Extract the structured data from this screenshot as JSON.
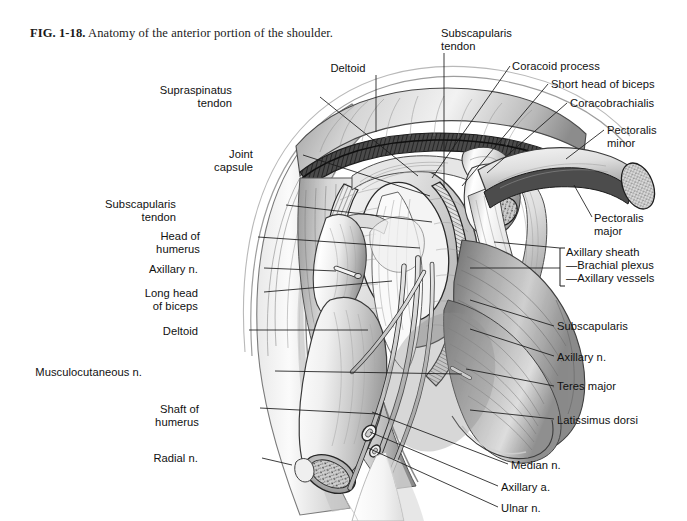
{
  "figure": {
    "number": "FIG. 1-18.",
    "caption": " Anatomy of the anterior portion of the shoulder.",
    "title": "Anatomy of the anterior portion of the shoulder",
    "type": "anatomical-illustration",
    "style": "grayscale pen-and-ink / airbrush medical illustration",
    "background_color": "#ffffff",
    "ink_color": "#1a1a1a"
  },
  "labels": {
    "left": [
      {
        "id": "supraspinatus-tendon",
        "text": "Supraspinatus\ntendon",
        "x": 232,
        "y": 84,
        "align": "right",
        "anchor_x": 320,
        "anchor_y": 97,
        "target_x": 418,
        "target_y": 176
      },
      {
        "id": "joint-capsule",
        "text": "Joint\ncapsule",
        "x": 253,
        "y": 148,
        "align": "right",
        "anchor_x": 303,
        "anchor_y": 155,
        "target_x": 430,
        "target_y": 196
      },
      {
        "id": "subscapularis-tendon-left",
        "text": "Subscapularis\ntendon",
        "x": 176,
        "y": 198,
        "align": "right",
        "anchor_x": 286,
        "anchor_y": 205,
        "target_x": 432,
        "target_y": 222
      },
      {
        "id": "head-of-humerus",
        "text": "Head of\nhumerus",
        "x": 200,
        "y": 230,
        "align": "right",
        "anchor_x": 258,
        "anchor_y": 237,
        "target_x": 420,
        "target_y": 248
      },
      {
        "id": "axillary-n-left",
        "text": "Axillary n.",
        "x": 198,
        "y": 263,
        "align": "right",
        "anchor_x": 264,
        "anchor_y": 268,
        "target_x": 336,
        "target_y": 271
      },
      {
        "id": "long-head-of-biceps",
        "text": "Long head\nof biceps",
        "x": 198,
        "y": 287,
        "align": "right",
        "anchor_x": 264,
        "anchor_y": 292,
        "target_x": 392,
        "target_y": 281
      },
      {
        "id": "deltoid-left",
        "text": "Deltoid",
        "x": 198,
        "y": 325,
        "align": "right",
        "anchor_x": 249,
        "anchor_y": 330,
        "target_x": 368,
        "target_y": 330
      },
      {
        "id": "musculocutaneous-n",
        "text": "Musculocutaneous n.",
        "x": 142,
        "y": 366,
        "align": "right",
        "anchor_x": 275,
        "anchor_y": 371,
        "target_x": 462,
        "target_y": 374
      },
      {
        "id": "shaft-of-humerus",
        "text": "Shaft of\nhumerus",
        "x": 199,
        "y": 403,
        "align": "right",
        "anchor_x": 260,
        "anchor_y": 408,
        "target_x": 378,
        "target_y": 414
      },
      {
        "id": "radial-n",
        "text": "Radial n.",
        "x": 198,
        "y": 452,
        "align": "right",
        "anchor_x": 262,
        "anchor_y": 458,
        "target_x": 292,
        "target_y": 465
      }
    ],
    "top": [
      {
        "id": "deltoid-top",
        "text": "Deltoid",
        "x": 348,
        "y": 62,
        "align": "center",
        "anchor_x": 376,
        "anchor_y": 75,
        "target_x": 376,
        "target_y": 132
      },
      {
        "id": "subscapularis-tendon-top",
        "text": "Subscapularis\ntendon",
        "x": 441,
        "y": 27,
        "align": "left",
        "anchor_x": 444,
        "anchor_y": 53,
        "target_x": 444,
        "target_y": 188
      }
    ],
    "right_upper": [
      {
        "id": "coracoid-process",
        "text": "Coracoid process",
        "x": 512,
        "y": 60,
        "align": "left",
        "anchor_x": 510,
        "anchor_y": 66,
        "target_x": 432,
        "target_y": 178
      },
      {
        "id": "short-head-of-biceps",
        "text": "Short head of biceps",
        "x": 551,
        "y": 78,
        "align": "left",
        "anchor_x": 548,
        "anchor_y": 84,
        "target_x": 462,
        "target_y": 186
      },
      {
        "id": "coracobrachialis",
        "text": "Coracobrachialis",
        "x": 570,
        "y": 97,
        "align": "left",
        "anchor_x": 567,
        "anchor_y": 103,
        "target_x": 487,
        "target_y": 173
      },
      {
        "id": "pectoralis-minor",
        "text": "Pectoralis\nminor",
        "x": 607,
        "y": 124,
        "align": "left",
        "anchor_x": 604,
        "anchor_y": 130,
        "target_x": 566,
        "target_y": 159
      },
      {
        "id": "pectoralis-major",
        "text": "Pectoralis\nmajor",
        "x": 594,
        "y": 212,
        "align": "left",
        "anchor_x": 592,
        "anchor_y": 217,
        "target_x": 574,
        "target_y": 185
      }
    ],
    "bracket_group": {
      "id": "axillary-sheath-group",
      "bracket_x": 560,
      "bracket_top": 248,
      "bracket_bottom": 286,
      "leader_x": 520,
      "leader_y": 268,
      "target_x": 470,
      "target_y": 268,
      "items": [
        {
          "id": "axillary-sheath",
          "text": "Axillary sheath",
          "x": 566,
          "y": 246,
          "dash": false
        },
        {
          "id": "brachial-plexus",
          "text": "Brachial plexus",
          "x": 566,
          "y": 259,
          "dash": true
        },
        {
          "id": "axillary-vessels",
          "text": "Axillary vessels",
          "x": 566,
          "y": 272,
          "dash": true
        }
      ]
    },
    "right_lower": [
      {
        "id": "subscapularis",
        "text": "Subscapularis",
        "x": 557,
        "y": 320,
        "align": "left",
        "anchor_x": 554,
        "anchor_y": 326,
        "target_x": 470,
        "target_y": 300
      },
      {
        "id": "axillary-n-right",
        "text": "Axillary n.",
        "x": 557,
        "y": 351,
        "align": "left",
        "anchor_x": 554,
        "anchor_y": 356,
        "target_x": 470,
        "target_y": 329
      },
      {
        "id": "teres-major",
        "text": "Teres major",
        "x": 557,
        "y": 380,
        "align": "left",
        "anchor_x": 554,
        "anchor_y": 386,
        "target_x": 466,
        "target_y": 369
      },
      {
        "id": "latissimus-dorsi",
        "text": "Latissimus dorsi",
        "x": 557,
        "y": 414,
        "align": "left",
        "anchor_x": 554,
        "anchor_y": 419,
        "target_x": 470,
        "target_y": 410
      },
      {
        "id": "median-n",
        "text": "Median n.",
        "x": 511,
        "y": 459,
        "align": "left",
        "anchor_x": 508,
        "anchor_y": 464,
        "target_x": 372,
        "target_y": 412
      },
      {
        "id": "axillary-a",
        "text": "Axillary a.",
        "x": 501,
        "y": 481,
        "align": "left",
        "anchor_x": 498,
        "anchor_y": 486,
        "target_x": 370,
        "target_y": 432
      },
      {
        "id": "ulnar-n",
        "text": "Ulnar n.",
        "x": 501,
        "y": 502,
        "align": "left",
        "anchor_x": 498,
        "anchor_y": 507,
        "target_x": 368,
        "target_y": 448
      }
    ]
  },
  "anatomy_structures": [
    "Deltoid",
    "Supraspinatus tendon",
    "Joint capsule",
    "Subscapularis tendon",
    "Head of humerus",
    "Shaft of humerus",
    "Long head of biceps",
    "Short head of biceps",
    "Coracoid process",
    "Coracobrachialis",
    "Pectoralis minor",
    "Pectoralis major",
    "Subscapularis",
    "Teres major",
    "Latissimus dorsi",
    "Axillary sheath",
    "Brachial plexus",
    "Axillary vessels",
    "Axillary n.",
    "Axillary a.",
    "Musculocutaneous n.",
    "Median n.",
    "Ulnar n.",
    "Radial n."
  ]
}
